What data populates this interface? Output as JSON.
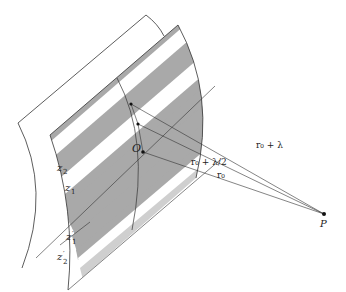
{
  "figure": {
    "labels": {
      "origin": "O",
      "point": "P",
      "zones_upper": [
        "z",
        "z"
      ],
      "zone_upper_subscripts": [
        "2",
        "1"
      ],
      "zones_lower": [
        "z",
        "z"
      ],
      "zone_lower_subscripts": [
        "1",
        "2"
      ],
      "zone_lower_prime": "′",
      "distance_r0": "r",
      "distance_r0_sub": "0",
      "distance_half": "r₀ + λ/2",
      "distance_full": "r₀ + λ"
    },
    "distances": [
      {
        "name": "r0",
        "label": "r₀"
      },
      {
        "name": "r0-plus-half-lambda",
        "label": "r₀ + λ/2"
      },
      {
        "name": "r0-plus-lambda",
        "label": "r₀ + λ"
      }
    ],
    "colors": {
      "stripe_dark": "#a9a9a9",
      "stripe_light": "#ffffff",
      "line": "#333333",
      "edge_shade": "#d9d9d9"
    }
  }
}
